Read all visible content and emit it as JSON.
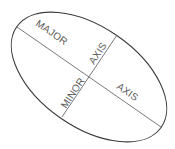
{
  "diagram": {
    "labels": {
      "major_1": "MAJOR",
      "major_2": "AXIS",
      "minor_1": "MINOR",
      "minor_2": "AXIS"
    },
    "colors": {
      "outline": "#3a3a3a",
      "axis_line": "#6a6a6a",
      "text": "#5a5a5a"
    }
  }
}
